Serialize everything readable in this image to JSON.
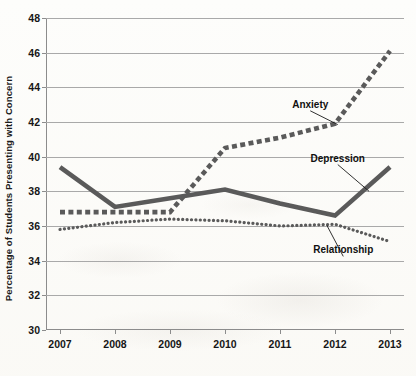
{
  "chart_data": {
    "type": "line",
    "title": "",
    "xlabel": "",
    "ylabel": "Percentage of Students Presenting with Concern",
    "categories": [
      "2007",
      "2008",
      "2009",
      "2010",
      "2011",
      "2012",
      "2013"
    ],
    "x": [
      2007,
      2008,
      2009,
      2010,
      2011,
      2012,
      2013
    ],
    "ylim": [
      30,
      48
    ],
    "yticks": [
      30,
      32,
      34,
      36,
      38,
      40,
      42,
      44,
      46,
      48
    ],
    "ytick_labels": [
      "30",
      "32",
      "34",
      "36",
      "38",
      "40",
      "42",
      "44",
      "46",
      "48"
    ],
    "grid": true,
    "legend_position": "inline-annotations",
    "series": [
      {
        "name": "Depression",
        "style": "solid",
        "color": "#5a5a5a",
        "values": [
          39.4,
          37.1,
          37.6,
          38.1,
          37.3,
          36.6,
          39.4
        ]
      },
      {
        "name": "Anxiety",
        "style": "square-dashed",
        "color": "#5a5a5a",
        "values": [
          36.8,
          36.8,
          36.8,
          40.5,
          41.1,
          41.9,
          46.1
        ]
      },
      {
        "name": "Relationship",
        "style": "dotted",
        "color": "#5a5a5a",
        "values": [
          35.8,
          36.2,
          36.4,
          36.3,
          36.0,
          36.1,
          35.1
        ]
      }
    ],
    "annotations": [
      {
        "text": "Anxiety",
        "label_x": 2011.55,
        "label_y": 43.05,
        "point_x": 2012.05,
        "point_y": 41.85
      },
      {
        "text": "Depression",
        "label_x": 2012.05,
        "label_y": 39.95,
        "point_x": 2012.62,
        "point_y": 38.0
      },
      {
        "text": "Relationship",
        "label_x": 2012.15,
        "label_y": 34.65,
        "point_x": 2011.85,
        "point_y": 36.05
      }
    ]
  }
}
